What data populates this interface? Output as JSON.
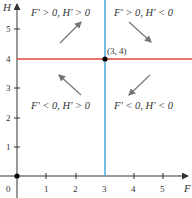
{
  "axes": {
    "x_label": "F",
    "y_label": "H",
    "origin_label": "0",
    "x_ticks": [
      "1",
      "2",
      "3",
      "4",
      "5"
    ],
    "y_ticks": [
      "1",
      "2",
      "3",
      "4",
      "5"
    ]
  },
  "lines": {
    "horizontal": {
      "equation": "H = 4",
      "color": "#e0463c"
    },
    "vertical": {
      "equation": "F = 3",
      "color": "#4aa8d8"
    }
  },
  "equilibrium_point": {
    "label": "(3, 4)",
    "F": 3,
    "H": 4
  },
  "regions": {
    "top_left": "F′ > 0, H′ > 0",
    "top_right": "F′ > 0, H′ < 0",
    "bottom_left": "F′ < 0, H′ > 0",
    "bottom_right": "F′ < 0, H′ < 0"
  },
  "arrows": {
    "top_left": "up-right",
    "top_right": "down-right",
    "bottom_left": "up-left",
    "bottom_right": "down-left"
  }
}
